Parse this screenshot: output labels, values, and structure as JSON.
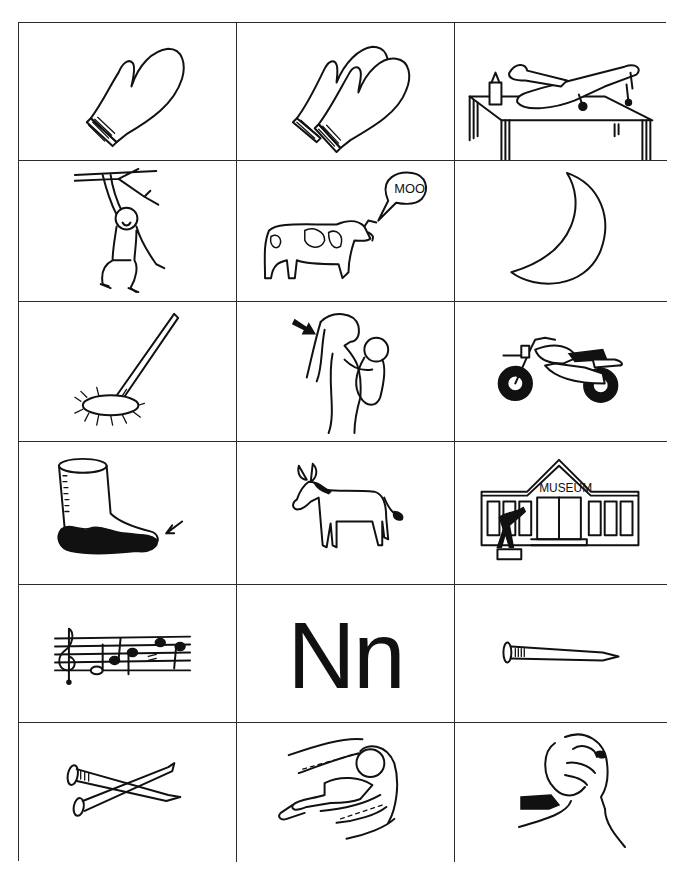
{
  "worksheet": {
    "title_letter": "Nn",
    "grid": {
      "rows": 6,
      "columns": 3,
      "cells": [
        {
          "row": 1,
          "col": 1,
          "picture": "mitten"
        },
        {
          "row": 1,
          "col": 2,
          "picture": "mittens"
        },
        {
          "row": 1,
          "col": 3,
          "picture": "model-airplane"
        },
        {
          "row": 2,
          "col": 1,
          "picture": "monkey"
        },
        {
          "row": 2,
          "col": 2,
          "picture": "cow-moo",
          "speech_text": "MOO"
        },
        {
          "row": 2,
          "col": 3,
          "picture": "moon"
        },
        {
          "row": 3,
          "col": 1,
          "picture": "mop"
        },
        {
          "row": 3,
          "col": 2,
          "picture": "mother"
        },
        {
          "row": 3,
          "col": 3,
          "picture": "motorcycle"
        },
        {
          "row": 4,
          "col": 1,
          "picture": "mud-boot"
        },
        {
          "row": 4,
          "col": 2,
          "picture": "mule"
        },
        {
          "row": 4,
          "col": 3,
          "picture": "museum",
          "sign_text": "MUSEUM"
        },
        {
          "row": 5,
          "col": 1,
          "picture": "music"
        },
        {
          "row": 5,
          "col": 2,
          "picture": "letter",
          "text": "Nn"
        },
        {
          "row": 5,
          "col": 3,
          "picture": "nail"
        },
        {
          "row": 6,
          "col": 1,
          "picture": "nails"
        },
        {
          "row": 6,
          "col": 2,
          "picture": "nap"
        },
        {
          "row": 6,
          "col": 3,
          "picture": "neck"
        }
      ]
    }
  },
  "colors": {
    "ink": "#111111",
    "border": "#2b2b2b",
    "background": "#ffffff"
  }
}
